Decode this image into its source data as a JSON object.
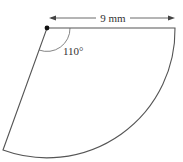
{
  "diagram": {
    "type": "circular-sector",
    "radius_label": "9 mm",
    "angle_label": "110°",
    "colors": {
      "stroke": "#555555",
      "text": "#333333",
      "center_dot": "#111111",
      "background": "#ffffff"
    }
  }
}
